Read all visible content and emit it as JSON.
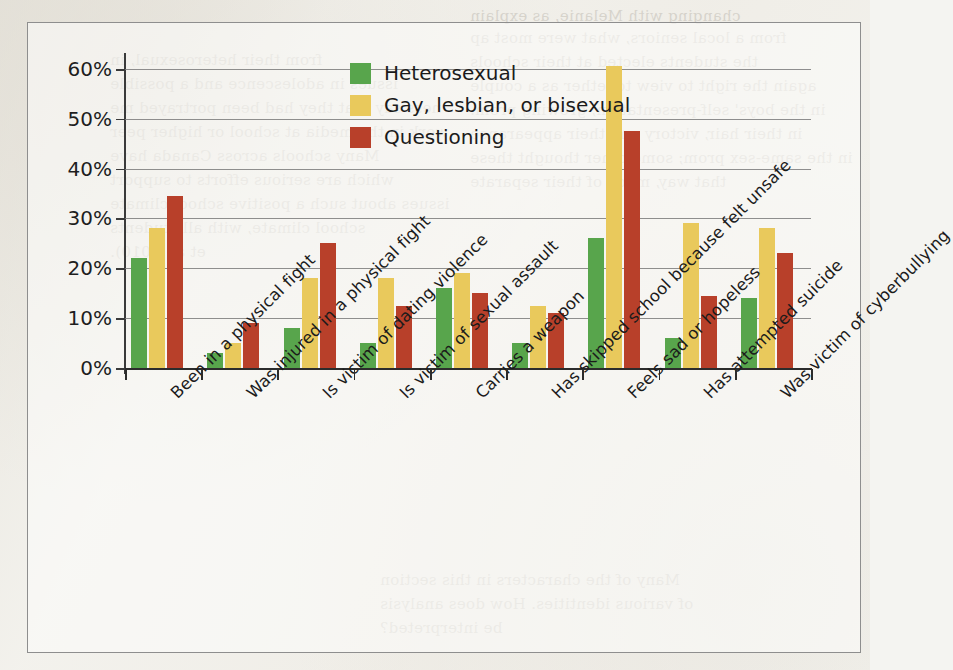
{
  "figure": {
    "background_color": "#fcfcfa",
    "border_color": "#8e8e8e"
  },
  "legend": {
    "position": "top-center-right",
    "entries": [
      {
        "label": "Heterosexual",
        "color": "#58a54c",
        "swatch_name": "legend-swatch-heterosexual"
      },
      {
        "label": "Gay, lesbian, or bisexual",
        "color": "#e9c95c",
        "swatch_name": "legend-swatch-gay-lesbian-bisexual"
      },
      {
        "label": "Questioning",
        "color": "#b8402a",
        "swatch_name": "legend-swatch-questioning"
      }
    ]
  },
  "axes": {
    "y_tick_labels": [
      "0%",
      "10%",
      "20%",
      "30%",
      "40%",
      "50%",
      "60%"
    ],
    "y_tick_values": [
      0,
      10,
      20,
      30,
      40,
      50,
      60
    ]
  },
  "chart_data": {
    "type": "bar",
    "title": "",
    "subtitle": "",
    "xlabel": "",
    "ylabel": "",
    "ylim": [
      0,
      62
    ],
    "grid": true,
    "legend_position": "top-center-right",
    "categories": [
      "Been in a physical fight",
      "Was injured in a physical fight",
      "Is victim of dating violence",
      "Is victim of sexual assault",
      "Carries a weapon",
      "Has skipped school because felt unsafe",
      "Feels sad or hopeless",
      "Has attempted suicide",
      "Was victim of cyberbullying"
    ],
    "series": [
      {
        "name": "Heterosexual",
        "color": "#58a54c",
        "values": [
          22,
          3,
          8,
          5,
          16,
          5,
          26,
          6,
          14
        ]
      },
      {
        "name": "Gay, lesbian, or bisexual",
        "color": "#e9c95c",
        "values": [
          28,
          5,
          18,
          18,
          19,
          12.5,
          60.5,
          29,
          28
        ]
      },
      {
        "name": "Questioning",
        "color": "#b8402a",
        "values": [
          34.5,
          9,
          25,
          12.5,
          15,
          11,
          47.5,
          14.5,
          23
        ]
      }
    ]
  },
  "background_ghost_text": [
    "changing with Melanie, as explain",
    "from a local seniors, what were most ap",
    "the students elected at their schools",
    "again the right to view together as a couple",
    "in the boys' self-presentation, growing prom.",
    "in their hair, victory and their appearance",
    "in the same-sex prom; some other thought these",
    "that way, much of their separate",
    "from their heterosexual, in",
    "issues in adolescence and a possible",
    "ness say that they had been portrayed me",
    "work in the media at school or higher peer",
    "Many schools across Canada have",
    "which are serious efforts to support",
    "issues about such a positive school climate",
    "school climate, with all students",
    "et al. 2010).",
    "Many of the characters in this section",
    "of various identities. How does analysis",
    "be interpreted?"
  ]
}
